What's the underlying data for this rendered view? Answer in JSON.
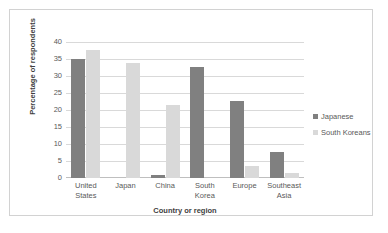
{
  "chart_data": {
    "type": "bar",
    "title": "",
    "subtitle": "",
    "xlabel": "Country or region",
    "ylabel": "Percentage of respondents",
    "categories": [
      "United States",
      "Japan",
      "China",
      "South Korea",
      "Europe",
      "Southeast Asia"
    ],
    "category_lines": [
      [
        "United",
        "States"
      ],
      [
        "Japan"
      ],
      [
        "China"
      ],
      [
        "South",
        "Korea"
      ],
      [
        "Europe"
      ],
      [
        "Southeast",
        "Asia"
      ]
    ],
    "series": [
      {
        "name": "Japanese",
        "color": "#808080",
        "values": [
          35.0,
          0,
          1.0,
          32.7,
          22.7,
          7.6
        ]
      },
      {
        "name": "South Koreans",
        "color": "#d9d9d9",
        "values": [
          37.7,
          33.8,
          21.5,
          0,
          3.6,
          1.6
        ]
      }
    ],
    "ylim": [
      0,
      40
    ],
    "ytick_step": 5,
    "ytick_labels": [
      "40",
      "35",
      "30",
      "25",
      "20",
      "15",
      "10",
      "5",
      "0"
    ],
    "grid": true,
    "grid_axis": "y",
    "legend_position": "right",
    "gridline_color": "#d9d9d9",
    "axis_color": "#bfbfbf",
    "border_color": "#d2d2d2",
    "background_color": "#ffffff"
  }
}
